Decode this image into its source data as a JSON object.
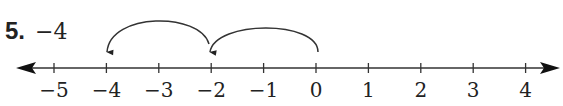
{
  "problem": {
    "number": "5.",
    "expression": "−4"
  },
  "number_line": {
    "min": -5,
    "max": 4,
    "step": 1,
    "tick_labels": [
      "−5",
      "−4",
      "−3",
      "−2",
      "−1",
      "0",
      "1",
      "2",
      "3",
      "4"
    ],
    "arrows_both_ends": true,
    "jumps": [
      {
        "from": 0,
        "to": -2,
        "label": ""
      },
      {
        "from": -2,
        "to": -4,
        "label": ""
      }
    ],
    "color": "#222222"
  }
}
